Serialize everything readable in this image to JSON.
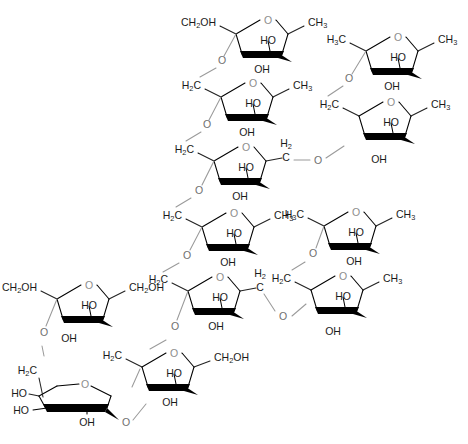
{
  "figure": {
    "background_color": "#ffffff",
    "bond_color": "#000000",
    "linkage_bond_color": "#9a9a9a",
    "ring_oxygen_color": "#8d8d8d",
    "width": 468,
    "height": 444
  },
  "labels": {
    "ch2oh": "CH",
    "ch2oh_sub": "2",
    "ch2oh_tail": "OH",
    "ch3": "CH",
    "ch3_sub": "3",
    "h3c": "H",
    "h3c_sub": "3",
    "h3c_tail": "C",
    "h2c": "H",
    "h2c_sub": "2",
    "h2c_tail": "C",
    "h2_top": "H",
    "h2_top_sub": "2",
    "c_only": "C",
    "ho": "HO",
    "oh": "OH",
    "o_ring": "O",
    "o_link": "O"
  },
  "rings": [
    {
      "id": "ring-1",
      "type": "furanose",
      "cx": 262,
      "cy": 40,
      "left_substituent": "CH2OH",
      "right_substituent": "CH3",
      "has_ho": true,
      "has_oh": true,
      "role": "terminal-top"
    },
    {
      "id": "ring-2",
      "type": "furanose",
      "cx": 247,
      "cy": 103,
      "left_substituent": "H2C",
      "right_substituent": "CH3",
      "has_ho": true,
      "has_oh": true,
      "role": "chain"
    },
    {
      "id": "ring-3",
      "type": "furanose",
      "cx": 240,
      "cy": 167,
      "left_substituent": "H2C",
      "right_substituent": "H2C-link",
      "has_ho": true,
      "has_oh": true,
      "role": "branch-point"
    },
    {
      "id": "ring-4",
      "type": "furanose",
      "cx": 392,
      "cy": 57,
      "left_substituent": "H3C",
      "right_substituent": "CH3",
      "has_ho": true,
      "has_oh": true,
      "role": "terminal-right-top"
    },
    {
      "id": "ring-5",
      "type": "furanose",
      "cx": 385,
      "cy": 122,
      "left_substituent": "H2C",
      "right_substituent": "CH3",
      "has_ho": true,
      "has_oh": true,
      "role": "chain"
    },
    {
      "id": "ring-6",
      "type": "furanose",
      "cx": 228,
      "cy": 233,
      "left_substituent": "H2C",
      "right_substituent": "CH3",
      "has_ho": true,
      "has_oh": true,
      "role": "chain"
    },
    {
      "id": "ring-7",
      "type": "furanose",
      "cx": 214,
      "cy": 297,
      "left_substituent": "H2C",
      "right_substituent": "H2C-link",
      "has_ho": true,
      "has_oh": true,
      "role": "branch-point"
    },
    {
      "id": "ring-8",
      "type": "furanose",
      "cx": 350,
      "cy": 232,
      "left_substituent": "H3C",
      "right_substituent": "CH3",
      "has_ho": true,
      "has_oh": true,
      "role": "terminal-right-mid"
    },
    {
      "id": "ring-9",
      "type": "furanose",
      "cx": 337,
      "cy": 296,
      "left_substituent": "H2C",
      "right_substituent": "CH3",
      "has_ho": true,
      "has_oh": true,
      "role": "chain"
    },
    {
      "id": "ring-10",
      "type": "furanose",
      "cx": 83,
      "cy": 305,
      "left_substituent": "CH2OH",
      "right_substituent": "CH2OH",
      "has_ho": true,
      "has_oh": true,
      "role": "terminal-left"
    },
    {
      "id": "ring-11",
      "type": "furanose",
      "cx": 168,
      "cy": 373,
      "left_substituent": "H2C",
      "right_substituent": "CH2OH",
      "has_ho": true,
      "has_oh": true,
      "role": "chain"
    },
    {
      "id": "ring-12",
      "type": "pyranose",
      "cx": 83,
      "cy": 400,
      "left_substituent": "H2C",
      "right_substituent": "O-link",
      "has_ho": true,
      "has_oh": true,
      "role": "reducing-end"
    }
  ],
  "linkages": [
    {
      "id": "link-1",
      "from": "ring-1",
      "to": "ring-2",
      "label": "O"
    },
    {
      "id": "link-2",
      "from": "ring-2",
      "to": "ring-3",
      "label": "O"
    },
    {
      "id": "link-3",
      "from": "ring-3",
      "to": "ring-5",
      "label": "O"
    },
    {
      "id": "link-4",
      "from": "ring-4",
      "to": "ring-5",
      "label": "O"
    },
    {
      "id": "link-5",
      "from": "ring-3",
      "to": "ring-6",
      "label": "O"
    },
    {
      "id": "link-6",
      "from": "ring-6",
      "to": "ring-7",
      "label": "O"
    },
    {
      "id": "link-7",
      "from": "ring-7",
      "to": "ring-9",
      "label": "O"
    },
    {
      "id": "link-8",
      "from": "ring-8",
      "to": "ring-9",
      "label": "O"
    },
    {
      "id": "link-9",
      "from": "ring-7",
      "to": "ring-11",
      "label": "O"
    },
    {
      "id": "link-10",
      "from": "ring-10",
      "to": "ring-12",
      "label": "O"
    },
    {
      "id": "link-11",
      "from": "ring-12",
      "to": "ring-11",
      "label": "O"
    }
  ],
  "caption": {
    "text": ""
  }
}
